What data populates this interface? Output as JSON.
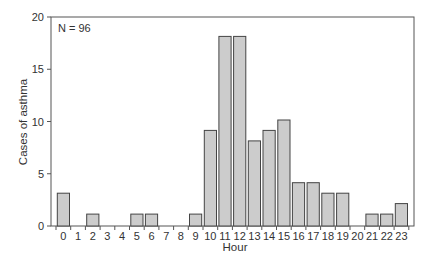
{
  "chart_data": {
    "type": "bar",
    "title": "",
    "xlabel": "Hour",
    "ylabel": "Cases of asthma",
    "annotation": "N = 96",
    "categories": [
      "0",
      "1",
      "2",
      "3",
      "4",
      "5",
      "6",
      "7",
      "8",
      "9",
      "10",
      "11",
      "12",
      "13",
      "14",
      "15",
      "16",
      "17",
      "18",
      "19",
      "20",
      "21",
      "22",
      "23"
    ],
    "values": [
      3,
      0,
      1,
      0,
      0,
      1,
      1,
      0,
      0,
      1,
      9,
      18,
      18,
      8,
      9,
      10,
      4,
      4,
      3,
      3,
      0,
      1,
      1,
      2
    ],
    "ylim": [
      0,
      20
    ],
    "yticks": [
      0,
      5,
      10,
      15,
      20
    ],
    "grid": false,
    "legend": null,
    "colors": {
      "bar_fill": "#cccccc",
      "bar_stroke": "#444444",
      "axis": "#555555"
    }
  }
}
